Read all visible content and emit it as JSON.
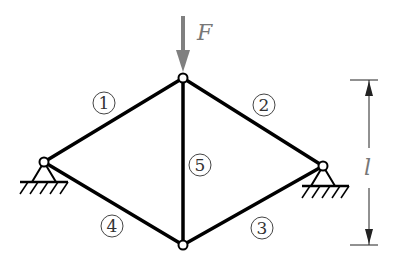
{
  "diagram": {
    "title": "",
    "force_label": "F",
    "length_label": "l",
    "members": [
      {
        "id": "1",
        "label": "1"
      },
      {
        "id": "2",
        "label": "2"
      },
      {
        "id": "3",
        "label": "3"
      },
      {
        "id": "4",
        "label": "4"
      },
      {
        "id": "5",
        "label": "5"
      }
    ],
    "colors": {
      "member": "#000000",
      "arrow": "#808080",
      "text": "#333333"
    }
  }
}
